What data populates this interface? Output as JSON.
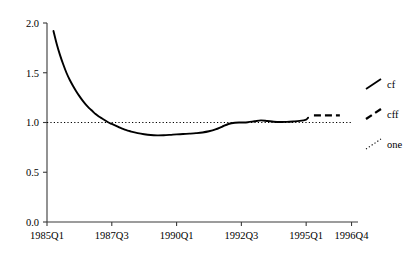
{
  "chart_data": {
    "type": "line",
    "title": "",
    "subtitle": "",
    "xlabel": "",
    "ylabel": "",
    "xlim": [
      0,
      48
    ],
    "ylim": [
      0.0,
      2.0
    ],
    "grid": false,
    "legend_position": "right-outside",
    "x_tick_labels": [
      "1985Q1",
      "1987Q3",
      "1990Q1",
      "1992Q3",
      "1995Q1",
      "1996Q4"
    ],
    "x_tick_values": [
      0,
      10,
      20,
      30,
      40,
      47
    ],
    "y_tick_labels": [
      "0.0",
      "0.5",
      "1.0",
      "1.5",
      "2.0"
    ],
    "y_tick_values": [
      0.0,
      0.5,
      1.0,
      1.5,
      2.0
    ],
    "series": [
      {
        "name": "cf",
        "style": "solid",
        "color": "#000000",
        "x": [
          1,
          1.5,
          2,
          2.5,
          3,
          3.5,
          4,
          4.5,
          5,
          5.5,
          6,
          6.5,
          7,
          7.5,
          8,
          8.5,
          9,
          9.5,
          10,
          10.5,
          11,
          11.5,
          12,
          12.5,
          13,
          14,
          15,
          16,
          17,
          18,
          19,
          20,
          21,
          22,
          23,
          24,
          25,
          26,
          27,
          28,
          29,
          30,
          31,
          32,
          33,
          34,
          35,
          36,
          37,
          38,
          39,
          40,
          40.3
        ],
        "values": [
          1.92,
          1.79,
          1.68,
          1.585,
          1.5,
          1.43,
          1.37,
          1.315,
          1.265,
          1.22,
          1.18,
          1.145,
          1.115,
          1.085,
          1.06,
          1.04,
          1.02,
          1.0,
          0.985,
          0.97,
          0.955,
          0.94,
          0.928,
          0.918,
          0.908,
          0.893,
          0.882,
          0.874,
          0.871,
          0.872,
          0.876,
          0.881,
          0.884,
          0.888,
          0.893,
          0.9,
          0.912,
          0.93,
          0.957,
          0.985,
          0.998,
          1.0,
          1.003,
          1.012,
          1.021,
          1.015,
          1.008,
          1.005,
          1.006,
          1.01,
          1.016,
          1.03,
          1.048
        ]
      },
      {
        "name": "cff",
        "style": "dashed",
        "color": "#000000",
        "x": [
          41.2,
          45.2
        ],
        "values": [
          1.072,
          1.072
        ]
      },
      {
        "name": "one",
        "style": "dotted",
        "color": "#000000",
        "x": [
          0,
          47
        ],
        "values": [
          1.0,
          1.0
        ]
      }
    ]
  },
  "legend": {
    "entries": [
      {
        "label": "cf",
        "style": "solid"
      },
      {
        "label": "cff",
        "style": "dashed"
      },
      {
        "label": "one",
        "style": "dotted"
      }
    ]
  }
}
